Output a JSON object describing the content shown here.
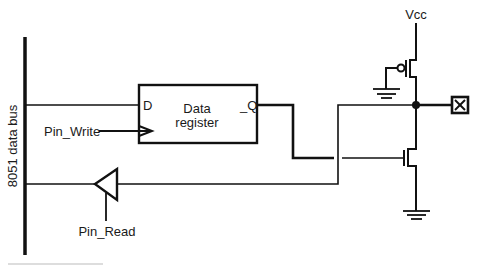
{
  "diagram": {
    "labels": {
      "bus": "8051 data bus",
      "register_line1": "Data",
      "register_line2": "register",
      "d_input": "D",
      "q_output": "_Q",
      "pin_write": "Pin_Write",
      "pin_read": "Pin_Read",
      "vcc": "Vcc"
    },
    "components": [
      {
        "id": "data-bus",
        "type": "bus"
      },
      {
        "id": "data-register",
        "type": "d-flip-flop",
        "inputs": [
          "D",
          "clock"
        ],
        "outputs": [
          "_Q"
        ]
      },
      {
        "id": "read-buffer",
        "type": "tri-state-buffer",
        "control": "Pin_Read"
      },
      {
        "id": "pull-up",
        "type": "pmos-transistor",
        "gate": "ground"
      },
      {
        "id": "pull-down",
        "type": "nmos-transistor",
        "gate": "_Q"
      },
      {
        "id": "output-pin",
        "type": "pin"
      },
      {
        "id": "ground-1",
        "type": "ground"
      },
      {
        "id": "ground-2",
        "type": "ground"
      }
    ],
    "connections": [
      {
        "from": "data-bus",
        "to": "data-register.D"
      },
      {
        "from": "Pin_Write",
        "to": "data-register.clock"
      },
      {
        "from": "data-register._Q",
        "to": "pull-down.gate"
      },
      {
        "from": "Vcc",
        "to": "pull-up.source"
      },
      {
        "from": "pull-up.drain",
        "to": "output-pin"
      },
      {
        "from": "pull-down.drain",
        "to": "output-pin"
      },
      {
        "from": "output-pin",
        "to": "read-buffer.input"
      },
      {
        "from": "read-buffer.output",
        "to": "data-bus"
      }
    ],
    "colors": {
      "line": "#111111",
      "background": "#ffffff",
      "footnote_rule": "#bbbbbb"
    }
  }
}
